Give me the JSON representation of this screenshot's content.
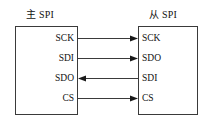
{
  "diagram": {
    "type": "spi-master-slave-connection",
    "background_color": "#ffffff",
    "line_color": "#3a3a3a",
    "text_color": "#111111",
    "master": {
      "title": "主 SPI",
      "pins": [
        {
          "label": "SCK"
        },
        {
          "label": "SDI"
        },
        {
          "label": "SDO"
        },
        {
          "label": "CS"
        }
      ]
    },
    "slave": {
      "title": "从 SPI",
      "pins": [
        {
          "label": "SCK"
        },
        {
          "label": "SDO"
        },
        {
          "label": "SDI"
        },
        {
          "label": "CS"
        }
      ]
    },
    "connections": [
      {
        "from": "SCK",
        "to": "SCK",
        "direction": "right"
      },
      {
        "from": "SDI",
        "to": "SDO",
        "direction": "right"
      },
      {
        "from": "SDO",
        "to": "SDI",
        "direction": "left"
      },
      {
        "from": "CS",
        "to": "CS",
        "direction": "right"
      }
    ]
  }
}
